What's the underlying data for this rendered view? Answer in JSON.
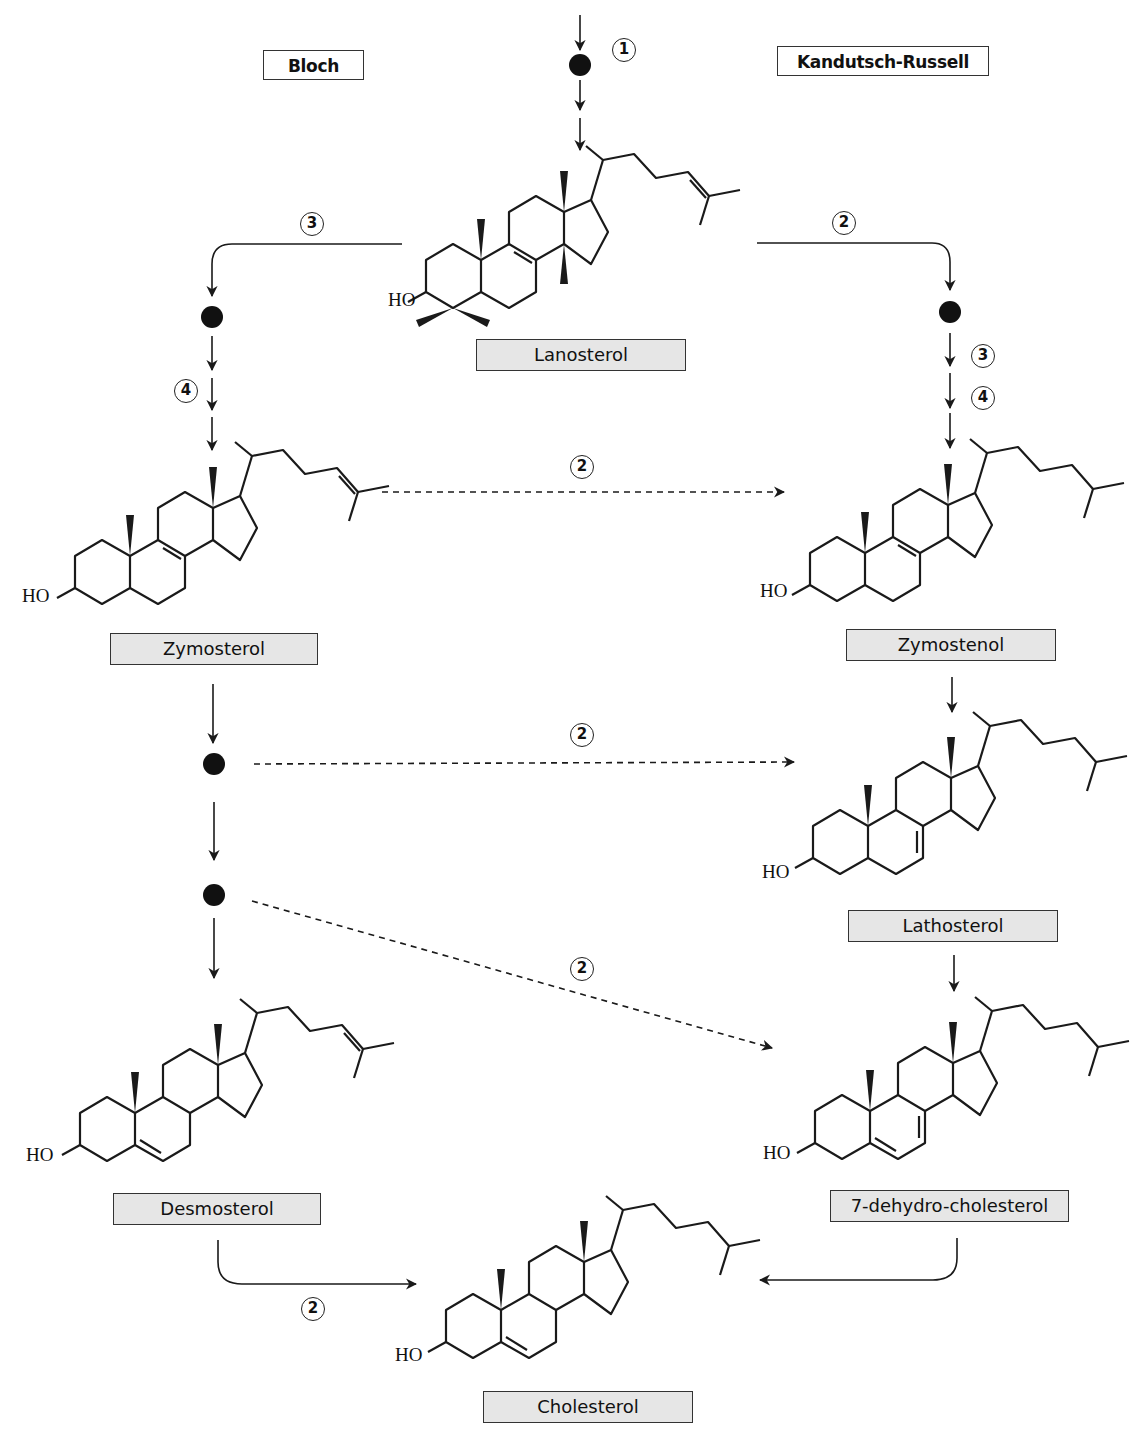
{
  "pathways": {
    "left": {
      "label": "Bloch"
    },
    "right": {
      "label": "Kandutsch-Russell"
    }
  },
  "compounds": {
    "lanosterol": {
      "label": "Lanosterol",
      "hydroxyl": "HO"
    },
    "zymosterol": {
      "label": "Zymosterol",
      "hydroxyl": "HO"
    },
    "zymostenol": {
      "label": "Zymostenol",
      "hydroxyl": "HO"
    },
    "lathosterol": {
      "label": "Lathosterol",
      "hydroxyl": "HO"
    },
    "desmosterol": {
      "label": "Desmosterol",
      "hydroxyl": "HO"
    },
    "dehydrocholesterol": {
      "label": "7-dehydro-cholesterol",
      "hydroxyl": "HO"
    },
    "cholesterol": {
      "label": "Cholesterol",
      "hydroxyl": "HO"
    }
  },
  "steps": {
    "top_1": "1",
    "bloch_3": "3",
    "bloch_4": "4",
    "kr_2": "2",
    "kr_3": "3",
    "kr_4": "4",
    "cross_zymosterol": "2",
    "cross_intermediate_1": "2",
    "cross_intermediate_2": "2",
    "desmosterol_to_cholesterol": "2"
  },
  "intermediates": {
    "count": 5,
    "description": "unnamed intermediates shown as filled black dots"
  },
  "colors": {
    "line": "#1a1a1a",
    "label_fill": "#e6e6e6",
    "label_border": "#333333",
    "background": "#ffffff"
  }
}
